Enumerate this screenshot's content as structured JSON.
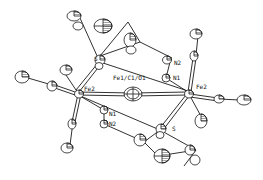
{
  "figure": {
    "type": "ORTEP molecular structure diagram",
    "colors": {
      "ink": "#1a1a1a",
      "background": "#ffffff"
    }
  },
  "labels": {
    "center": "Fe1/C1/O1",
    "fe2_left": "Fe2",
    "fe2_right": "Fe2",
    "s_top": "S",
    "s_bottom": "S",
    "n1_left": "N1",
    "n2_left": "N2",
    "n1_right": "N1",
    "n2_right": "N2"
  }
}
